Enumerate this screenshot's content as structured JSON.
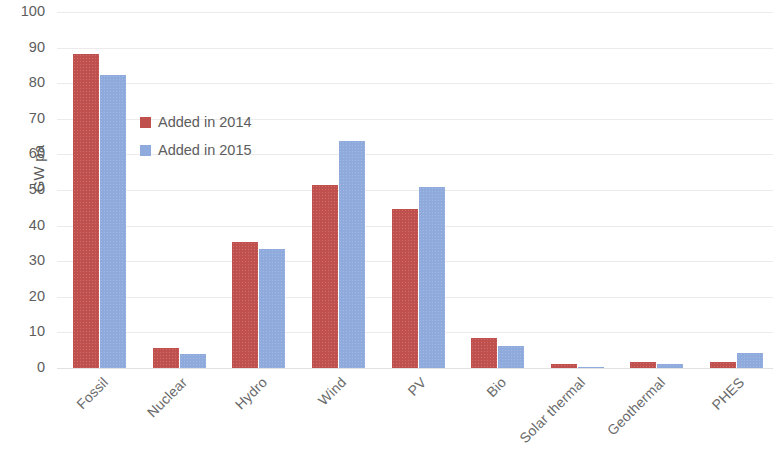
{
  "chart_data": {
    "type": "bar",
    "title": "",
    "subtitle": "",
    "xlabel": "",
    "ylabel": "GW pa",
    "ylim": [
      0,
      100
    ],
    "yticks": [
      0,
      10,
      20,
      30,
      40,
      50,
      60,
      70,
      80,
      90,
      100
    ],
    "grid": true,
    "legend_position": "inside-upper-left",
    "categories": [
      "Fossil",
      "Nuclear",
      "Hydro",
      "Wind",
      "PV",
      "Bio",
      "Solar thermal",
      "Geothermal",
      "PHES"
    ],
    "series": [
      {
        "name": "Added in 2014",
        "color": "#c0504d",
        "values": [
          88.3,
          5.5,
          35.5,
          51.5,
          44.8,
          8.3,
          1.2,
          1.6,
          1.8
        ]
      },
      {
        "name": "Added in 2015",
        "color": "#8faadc",
        "values": [
          82.2,
          3.8,
          33.3,
          63.8,
          50.8,
          6.2,
          0.2,
          1.1,
          4.3
        ]
      }
    ]
  },
  "axis": {
    "y_title": "GW pa",
    "y_tick_labels": [
      "100",
      "90",
      "80",
      "70",
      "60",
      "50",
      "40",
      "30",
      "20",
      "10",
      "0"
    ]
  },
  "legend": {
    "items": [
      {
        "label": "Added in 2014",
        "color": "#c0504d"
      },
      {
        "label": "Added in 2015",
        "color": "#8faadc"
      }
    ]
  }
}
